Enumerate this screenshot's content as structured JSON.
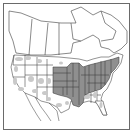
{
  "map": {
    "type": "species-distribution-map",
    "region": "North America (Canada and United States)",
    "legend": {
      "present_state_color": "#8f8f8f",
      "present_county_color": "#c9c9c9",
      "absent_color": "#ffffff",
      "border_color": "#3a3a3a",
      "frame_color": "#6a6a6a"
    },
    "present_states": [
      "ND-east",
      "SD",
      "NE",
      "KS",
      "OK",
      "MN",
      "IA",
      "MO",
      "AR",
      "LA",
      "WI",
      "IL",
      "IN",
      "MI",
      "OH",
      "KY",
      "TN",
      "MS",
      "WV",
      "PA",
      "NY",
      "VT",
      "NH",
      "ME",
      "MA",
      "CT",
      "RI",
      "NJ",
      "DE",
      "MD",
      "VA",
      "NC"
    ],
    "county_level_states": [
      "WA",
      "OR",
      "CA",
      "ID",
      "MT",
      "WY",
      "NV",
      "UT",
      "CO",
      "AZ",
      "NM",
      "TX",
      "AL",
      "GA",
      "SC",
      "FL"
    ]
  }
}
